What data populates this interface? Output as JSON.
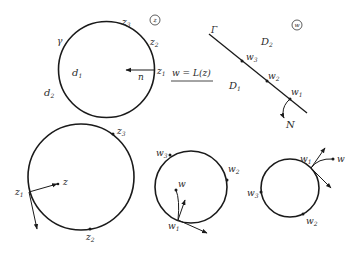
{
  "colors": {
    "ink": "#1a1a1a",
    "background": "#ffffff"
  },
  "panel_z": {
    "plane_badge": "z",
    "region_inner": "d",
    "region_inner_sub": "1",
    "region_outer": "d",
    "region_outer_sub": "2",
    "contour_label": "γ",
    "normal_label": "n",
    "points": [
      {
        "base": "z",
        "sub": "1"
      },
      {
        "base": "z",
        "sub": "2"
      },
      {
        "base": "z",
        "sub": "3"
      }
    ]
  },
  "mapping": {
    "label": "w = L(z)"
  },
  "panel_w": {
    "plane_badge": "w",
    "line_label": "Γ",
    "region_upper": "D",
    "region_upper_sub": "2",
    "region_lower": "D",
    "region_lower_sub": "1",
    "normal_label": "N",
    "points": [
      {
        "base": "w",
        "sub": "1"
      },
      {
        "base": "w",
        "sub": "2"
      },
      {
        "base": "w",
        "sub": "3"
      }
    ]
  },
  "bottom_circle_z": {
    "interior_point": "z",
    "points": [
      {
        "base": "z",
        "sub": "1"
      },
      {
        "base": "z",
        "sub": "2"
      },
      {
        "base": "z",
        "sub": "3"
      }
    ]
  },
  "bottom_circle_w_inside": {
    "interior_point": "w",
    "points": [
      {
        "base": "w",
        "sub": "1"
      },
      {
        "base": "w",
        "sub": "2"
      },
      {
        "base": "w",
        "sub": "3"
      }
    ]
  },
  "bottom_circle_w_outside": {
    "exterior_point": "w",
    "points": [
      {
        "base": "w",
        "sub": "1"
      },
      {
        "base": "w",
        "sub": "2"
      },
      {
        "base": "w",
        "sub": "3"
      }
    ]
  }
}
